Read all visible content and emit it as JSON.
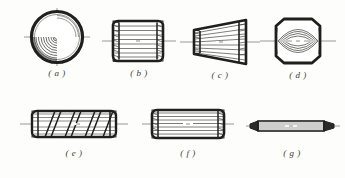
{
  "document": {
    "type": "engineering-drawing",
    "subject": "knurled and grooved pin types",
    "background_color": "#fdfdfb",
    "ink_color": "#2b2b29",
    "line_color": "#6e6e6a"
  },
  "figures": [
    {
      "id": "a",
      "caption": "( a )",
      "name": "end-view-circular-knurled-head",
      "shape": "circle",
      "description": "circular end view with concentric arcs and crosshair centerlines",
      "row": 1
    },
    {
      "id": "b",
      "caption": "( b )",
      "name": "straight-knurled-cylindrical-pin",
      "shape": "cylinder",
      "description": "short cylindrical pin with straight axial grooves and serrated ends",
      "row": 1
    },
    {
      "id": "c",
      "caption": "( c )",
      "name": "tapered-grooved-pin",
      "shape": "cone",
      "description": "tapered conical pin, narrow left and wide right, converging grooves",
      "row": 1
    },
    {
      "id": "d",
      "caption": "( d )",
      "name": "barrel-center-grooved-pin",
      "shape": "barrel",
      "description": "octagonal barrel outline with lens shaped centre grooves",
      "row": 1
    },
    {
      "id": "e",
      "caption": "( e )",
      "name": "helical-grooved-pin",
      "shape": "cylinder",
      "description": "long cylinder with diagonal helical grooves",
      "row": 2
    },
    {
      "id": "f",
      "caption": "( f )",
      "name": "long-straight-knurled-pin",
      "shape": "cylinder",
      "description": "long cylindrical pin with straight axial grooves",
      "row": 2
    },
    {
      "id": "g",
      "caption": "( g )",
      "name": "double-pointed-taper-pin",
      "shape": "rod",
      "description": "slender rod with conical points on both ends",
      "row": 2
    }
  ],
  "captions": {
    "a": "( a )",
    "b": "( b )",
    "c": "( c )",
    "d": "( d )",
    "e": "( e )",
    "f": "( f )",
    "g": "( g )"
  }
}
